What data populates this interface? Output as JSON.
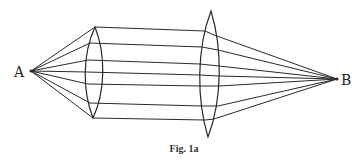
{
  "figure": {
    "caption": "Fig. 1a",
    "point_a": {
      "label": "A",
      "x": 31,
      "y": 71
    },
    "point_b": {
      "label": "B",
      "x": 337,
      "y": 79
    },
    "line_color": "#2a2a2a",
    "lenses": [
      {
        "name": "left-lens",
        "top": [
          95,
          27
        ],
        "bottom": [
          93,
          118
        ],
        "bulge": 9
      },
      {
        "name": "right-lens",
        "top": [
          211,
          11
        ],
        "bottom": [
          208,
          137
        ],
        "bulge": 10
      }
    ],
    "rays": {
      "count": 7,
      "at_left_lens": [
        [
          95,
          27
        ],
        [
          90,
          43
        ],
        [
          88,
          60
        ],
        [
          87,
          72
        ],
        [
          88,
          84
        ],
        [
          90,
          103
        ],
        [
          93,
          118
        ]
      ],
      "at_right_lens_in": [
        [
          205,
          31
        ],
        [
          202,
          47
        ],
        [
          200,
          64
        ],
        [
          200,
          75
        ],
        [
          200,
          86
        ],
        [
          202,
          106
        ],
        [
          205,
          120
        ]
      ],
      "at_right_lens_out": [
        [
          214,
          35
        ],
        [
          218,
          50
        ],
        [
          219,
          66
        ],
        [
          219,
          76
        ],
        [
          219,
          86
        ],
        [
          218,
          106
        ],
        [
          214,
          119
        ]
      ]
    }
  }
}
